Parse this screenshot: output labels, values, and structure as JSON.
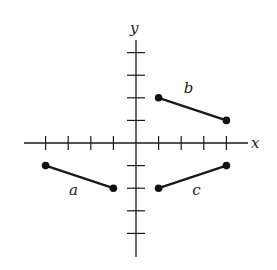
{
  "diagram": {
    "type": "coordinate-plane",
    "axes": {
      "x_label": "x",
      "y_label": "y",
      "x_ticks": [
        -4,
        -3,
        -2,
        -1,
        1,
        2,
        3,
        4
      ],
      "y_ticks": [
        -4,
        -3,
        -2,
        -1,
        1,
        2,
        3,
        4
      ]
    },
    "segments": [
      {
        "label": "a",
        "start": [
          -4,
          -1
        ],
        "end": [
          -1,
          -2
        ]
      },
      {
        "label": "b",
        "start": [
          1,
          2
        ],
        "end": [
          4,
          1
        ]
      },
      {
        "label": "c",
        "start": [
          1,
          -2
        ],
        "end": [
          4,
          -1
        ]
      }
    ],
    "colors": {
      "ink": "#1a1a1a",
      "background": "#ffffff"
    }
  }
}
